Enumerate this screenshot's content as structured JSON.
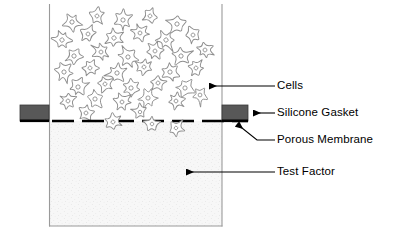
{
  "figure": {
    "background_color": "#ffffff"
  },
  "labels": {
    "cells": "Cells",
    "silicone_gasket": "Silicone Gasket",
    "porous_membrane": "Porous Membrane",
    "test_factor": "Test Factor"
  },
  "colors": {
    "outline": "#000000",
    "chamber_wall": "#9a9a9a",
    "gasket_fill": "#585858",
    "gasket_edge": "#000000",
    "membrane": "#000000",
    "cell_outline": "#8d8d8d",
    "test_factor_fill": "#f6f6f6",
    "leader_line": "#000000"
  },
  "chamber": {
    "left_wall_x": 49,
    "right_wall_x": 222,
    "top_y": 4,
    "bottom_y": 226,
    "membrane_y": 121,
    "upper_compartment_label": "Cells",
    "lower_compartment_label": "Test Factor"
  },
  "gaskets": [
    {
      "side": "left",
      "x": 20,
      "y": 105,
      "width": 29,
      "height": 16
    },
    {
      "side": "right",
      "x": 222,
      "y": 105,
      "width": 26,
      "height": 16
    }
  ],
  "membrane": {
    "y": 121,
    "x_start": 52,
    "x_end": 248,
    "dash_length": 22,
    "gap_length": 8,
    "thickness": 2.6
  },
  "leaders": [
    {
      "name": "cells",
      "type": "arrow-left",
      "x1": 275,
      "y1": 86,
      "x2": 209,
      "y2": 86
    },
    {
      "name": "silicone-gasket",
      "type": "arrow-left",
      "x1": 275,
      "y1": 113,
      "x2": 252,
      "y2": 113
    },
    {
      "name": "porous-membrane",
      "type": "arrow-diagonal",
      "x1": 275,
      "y1": 140,
      "x2": 237,
      "y2": 124
    },
    {
      "name": "test-factor",
      "type": "arrow-left",
      "x1": 275,
      "y1": 172,
      "x2": 186,
      "y2": 172
    }
  ],
  "cells_upper": [
    {
      "x": 72,
      "y": 22,
      "r": 11,
      "rot": 18
    },
    {
      "x": 97,
      "y": 16,
      "r": 10,
      "rot": 55
    },
    {
      "x": 123,
      "y": 20,
      "r": 11,
      "rot": 100
    },
    {
      "x": 150,
      "y": 16,
      "r": 10,
      "rot": 150
    },
    {
      "x": 177,
      "y": 24,
      "r": 11,
      "rot": 200
    },
    {
      "x": 62,
      "y": 40,
      "r": 11,
      "rot": 240
    },
    {
      "x": 88,
      "y": 34,
      "r": 10,
      "rot": 285
    },
    {
      "x": 114,
      "y": 38,
      "r": 11,
      "rot": 330
    },
    {
      "x": 140,
      "y": 33,
      "r": 10,
      "rot": 12
    },
    {
      "x": 166,
      "y": 40,
      "r": 11,
      "rot": 62
    },
    {
      "x": 193,
      "y": 35,
      "r": 10,
      "rot": 110
    },
    {
      "x": 74,
      "y": 56,
      "r": 11,
      "rot": 155
    },
    {
      "x": 101,
      "y": 52,
      "r": 10,
      "rot": 205
    },
    {
      "x": 128,
      "y": 57,
      "r": 11,
      "rot": 250
    },
    {
      "x": 155,
      "y": 51,
      "r": 10,
      "rot": 295
    },
    {
      "x": 181,
      "y": 56,
      "r": 11,
      "rot": 340
    },
    {
      "x": 205,
      "y": 50,
      "r": 10,
      "rot": 25
    },
    {
      "x": 64,
      "y": 72,
      "r": 11,
      "rot": 70
    },
    {
      "x": 90,
      "y": 68,
      "r": 10,
      "rot": 118
    },
    {
      "x": 117,
      "y": 73,
      "r": 11,
      "rot": 165
    },
    {
      "x": 144,
      "y": 67,
      "r": 10,
      "rot": 212
    },
    {
      "x": 170,
      "y": 72,
      "r": 11,
      "rot": 258
    },
    {
      "x": 196,
      "y": 68,
      "r": 10,
      "rot": 305
    },
    {
      "x": 78,
      "y": 87,
      "r": 11,
      "rot": 350
    },
    {
      "x": 105,
      "y": 84,
      "r": 10,
      "rot": 35
    },
    {
      "x": 131,
      "y": 88,
      "r": 11,
      "rot": 80
    },
    {
      "x": 158,
      "y": 83,
      "r": 10,
      "rot": 128
    },
    {
      "x": 185,
      "y": 88,
      "r": 11,
      "rot": 175
    },
    {
      "x": 68,
      "y": 101,
      "r": 10,
      "rot": 220
    },
    {
      "x": 95,
      "y": 99,
      "r": 11,
      "rot": 265
    },
    {
      "x": 122,
      "y": 102,
      "r": 10,
      "rot": 312
    },
    {
      "x": 148,
      "y": 98,
      "r": 11,
      "rot": 358
    },
    {
      "x": 176,
      "y": 101,
      "r": 10,
      "rot": 45
    },
    {
      "x": 200,
      "y": 95,
      "r": 10,
      "rot": 92
    },
    {
      "x": 86,
      "y": 113,
      "r": 10,
      "rot": 140
    },
    {
      "x": 140,
      "y": 112,
      "r": 9,
      "rot": 188
    }
  ],
  "cells_crossing": [
    {
      "x": 113,
      "y": 122,
      "r": 10,
      "rot": 30
    },
    {
      "x": 152,
      "y": 124,
      "r": 9,
      "rot": 205
    },
    {
      "x": 176,
      "y": 128,
      "r": 9,
      "rot": 300
    }
  ]
}
